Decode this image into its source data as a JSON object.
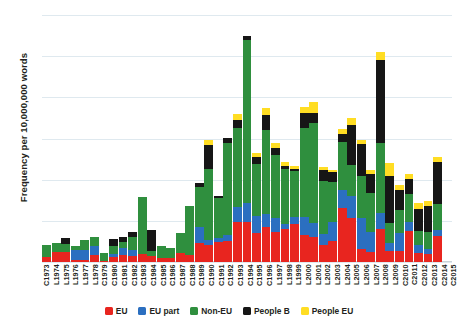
{
  "chart_data": {
    "type": "bar",
    "subtype": "stacked-bar",
    "title": "",
    "xlabel": "",
    "ylabel": "Frequency per 10,000,000 words",
    "ylim": [
      0,
      60
    ],
    "yticks": [
      0,
      10,
      20,
      30,
      40,
      50,
      60
    ],
    "grid": true,
    "legend_position": "bottom",
    "categories": [
      "C1973",
      "L1974",
      "L1975",
      "L1976",
      "L1977",
      "L1978",
      "C1979",
      "C1980",
      "C1981",
      "C1982",
      "C1983",
      "C1984",
      "C1985",
      "C1986",
      "C1987",
      "C1988",
      "C1989",
      "C1990",
      "C1991",
      "C1992",
      "C1993",
      "C1994",
      "C1995",
      "C1996",
      "L1997",
      "L1998",
      "L1999",
      "L2000",
      "L2001",
      "L2002",
      "L2003",
      "L2004",
      "L2005",
      "L2006",
      "L2007",
      "L2008",
      "L2009",
      "C2010",
      "C2011",
      "C2012",
      "C2013",
      "C2014",
      "C2015"
    ],
    "series": [
      {
        "name": "EU",
        "color": "#e8251f",
        "values": [
          1.2,
          2.4,
          2.5,
          0.4,
          0.4,
          1.6,
          0.3,
          1.2,
          1.6,
          1.4,
          2.0,
          1.4,
          1.0,
          1.0,
          2.2,
          1.6,
          4.6,
          4.2,
          4.8,
          5.2,
          9.8,
          9.6,
          7.0,
          8.6,
          7.4,
          8.0,
          9.2,
          6.6,
          6.0,
          4.2,
          5.0,
          13.0,
          10.6,
          3.2,
          2.4,
          8.0,
          2.6,
          2.6,
          7.6,
          2.2,
          2.0,
          6.2,
          0.0
        ]
      },
      {
        "name": "EU part",
        "color": "#2b6fc0",
        "values": [
          0.0,
          0.0,
          0.0,
          2.6,
          2.4,
          2.4,
          0.0,
          0.8,
          1.8,
          1.6,
          0.0,
          0.0,
          0.0,
          0.0,
          0.0,
          0.0,
          3.8,
          1.2,
          1.0,
          1.4,
          3.6,
          4.8,
          4.2,
          3.0,
          3.4,
          1.2,
          1.8,
          4.4,
          3.4,
          2.6,
          4.8,
          4.4,
          5.4,
          7.4,
          4.8,
          4.0,
          2.0,
          4.4,
          2.2,
          2.0,
          1.2,
          1.6,
          0.0
        ]
      },
      {
        "name": "Non-EU",
        "color": "#2f8f3e",
        "values": [
          3.0,
          2.2,
          2.0,
          1.0,
          2.6,
          2.0,
          2.0,
          2.0,
          1.4,
          3.0,
          13.8,
          1.2,
          2.8,
          2.4,
          4.8,
          12.0,
          9.8,
          17.2,
          9.8,
          22.4,
          19.2,
          39.6,
          12.6,
          20.4,
          15.2,
          13.4,
          11.0,
          21.6,
          24.4,
          12.8,
          9.6,
          11.8,
          7.6,
          10.4,
          9.6,
          16.8,
          4.8,
          5.6,
          6.8,
          3.4,
          4.2,
          6.4,
          0.0
        ]
      },
      {
        "name": "People B",
        "color": "#161616",
        "values": [
          0.0,
          0.0,
          1.4,
          0.0,
          0.0,
          0.0,
          0.0,
          1.6,
          1.2,
          1.2,
          0.0,
          5.2,
          0.0,
          0.0,
          0.0,
          0.0,
          1.0,
          5.8,
          0.4,
          1.2,
          2.0,
          0.8,
          1.6,
          3.6,
          1.6,
          0.8,
          0.6,
          3.6,
          2.4,
          2.8,
          2.4,
          1.8,
          9.8,
          7.6,
          4.6,
          20.2,
          11.4,
          4.8,
          3.6,
          5.4,
          6.2,
          10.0,
          0.0
        ]
      },
      {
        "name": "People EU",
        "color": "#ffdd23",
        "values": [
          0.0,
          0.0,
          0.0,
          0.0,
          0.0,
          0.0,
          0.0,
          0.0,
          0.0,
          0.0,
          0.0,
          0.0,
          0.0,
          0.0,
          0.0,
          0.0,
          0.0,
          1.2,
          0.0,
          0.0,
          1.4,
          0.0,
          1.2,
          1.8,
          1.4,
          1.0,
          0.8,
          1.4,
          2.8,
          0.8,
          0.6,
          1.2,
          1.6,
          1.0,
          1.0,
          2.0,
          3.2,
          1.2,
          1.2,
          1.4,
          1.2,
          1.4,
          0.0
        ]
      }
    ]
  },
  "legend": {
    "items": [
      {
        "label": "EU",
        "color": "#e8251f"
      },
      {
        "label": "EU part",
        "color": "#2b6fc0"
      },
      {
        "label": "Non-EU",
        "color": "#2f8f3e"
      },
      {
        "label": "People B",
        "color": "#161616"
      },
      {
        "label": "People EU",
        "color": "#ffdd23"
      }
    ]
  }
}
